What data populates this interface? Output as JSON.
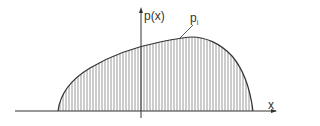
{
  "diagram": {
    "labels": {
      "y_axis": "p(x)",
      "x_axis": "x",
      "strip_base": "p",
      "strip_sub": "i"
    },
    "colors": {
      "line": "#333333",
      "hatch": "#555555",
      "background": "#ffffff"
    },
    "geometry": {
      "x_axis": {
        "x1": 15,
        "x2": 277,
        "y": 111
      },
      "y_axis": {
        "x": 141,
        "y1": 8,
        "y2": 118
      },
      "curve_start_x": 58,
      "curve_end_x": 253,
      "peak": {
        "x": 190,
        "y": 37
      },
      "strip_spacing": 3
    }
  }
}
